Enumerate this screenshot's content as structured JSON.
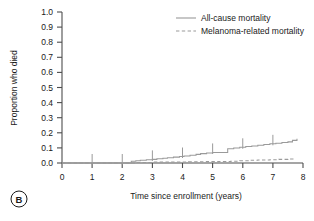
{
  "panel": {
    "letter": "B"
  },
  "axes": {
    "x": {
      "title": "Time since enrollment (years)",
      "ticks": [
        "0",
        "1",
        "2",
        "3",
        "4",
        "5",
        "6",
        "7",
        "8"
      ],
      "min": 0,
      "max": 8
    },
    "y": {
      "title": "Proportion who died",
      "ticks": [
        "0.0",
        "0.1",
        "0.2",
        "0.3",
        "0.4",
        "0.5",
        "0.6",
        "0.7",
        "0.8",
        "0.9",
        "1.0"
      ],
      "min": 0,
      "max": 1
    }
  },
  "legend": {
    "position": "top-right",
    "entries": [
      {
        "label": "All-cause mortality",
        "style": "solid",
        "color": "#9a9a9a"
      },
      {
        "label": "Melanoma-related mortality",
        "style": "dashed",
        "color": "#9a9a9a"
      }
    ]
  },
  "chart_data": {
    "type": "line",
    "title": "",
    "subtitle": "",
    "xlabel": "Time since enrollment (years)",
    "ylabel": "Proportion who died",
    "xlim": [
      0,
      8
    ],
    "ylim": [
      0,
      1
    ],
    "grid": false,
    "legend_position": "top-right",
    "plot_style": "kaplan-meier-step",
    "series": [
      {
        "name": "All-cause mortality",
        "style": "solid",
        "color": "#9a9a9a",
        "x": [
          0,
          2.15,
          2.3,
          2.45,
          2.6,
          2.8,
          3.0,
          3.15,
          3.35,
          3.5,
          3.7,
          3.9,
          4.05,
          4.25,
          4.45,
          4.6,
          4.8,
          5.0,
          5.2,
          5.45,
          5.5,
          5.7,
          5.9,
          6.1,
          6.3,
          6.5,
          6.7,
          6.9,
          7.1,
          7.3,
          7.5,
          7.65,
          7.8
        ],
        "y": [
          0.0,
          0.0,
          0.012,
          0.015,
          0.018,
          0.021,
          0.024,
          0.028,
          0.031,
          0.035,
          0.039,
          0.043,
          0.047,
          0.052,
          0.057,
          0.062,
          0.066,
          0.07,
          0.07,
          0.07,
          0.095,
          0.1,
          0.104,
          0.109,
          0.113,
          0.118,
          0.122,
          0.127,
          0.131,
          0.136,
          0.14,
          0.15,
          0.16
        ],
        "censor_x": [
          1.0,
          2.0,
          3.0,
          4.0,
          5.0,
          6.0,
          7.0
        ],
        "final_value": 0.16
      },
      {
        "name": "Melanoma-related mortality",
        "style": "dashed",
        "color": "#9a9a9a",
        "x": [
          0,
          2.2,
          2.5,
          3.0,
          3.6,
          4.2,
          4.8,
          5.2,
          5.6,
          5.9,
          6.2,
          6.5,
          6.9,
          7.2,
          7.5,
          7.7
        ],
        "y": [
          0.0,
          0.0,
          0.004,
          0.006,
          0.007,
          0.008,
          0.009,
          0.01,
          0.012,
          0.015,
          0.018,
          0.02,
          0.022,
          0.024,
          0.026,
          0.028
        ],
        "censor_x": [],
        "final_value": 0.028
      }
    ]
  }
}
